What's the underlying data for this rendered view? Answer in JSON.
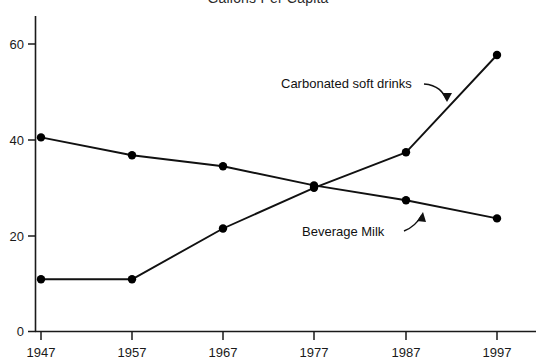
{
  "chart_data": {
    "type": "line",
    "title": "Gallons Per Capita",
    "xlabel": "",
    "ylabel": "",
    "x": [
      1947,
      1957,
      1967,
      1977,
      1987,
      1997
    ],
    "xtick_labels": [
      "1947",
      "1957",
      "1967",
      "1977",
      "1987",
      "1997"
    ],
    "ytick_labels": [
      "0",
      "20",
      "40",
      "60"
    ],
    "yticks": [
      0,
      20,
      40,
      60
    ],
    "ylim": [
      0,
      64
    ],
    "xlim": [
      1943,
      2000
    ],
    "grid": false,
    "legend": "none",
    "marker": "filled-circle",
    "series": [
      {
        "name": "Beverage Milk",
        "values": [
          40.5,
          36.8,
          34.5,
          30.5,
          27.4,
          23.6
        ]
      },
      {
        "name": "Carbonated soft drinks",
        "values": [
          10.9,
          10.9,
          21.5,
          30.0,
          37.4,
          57.7
        ]
      }
    ],
    "annotations": [
      {
        "text": "Carbonated soft drinks",
        "arrow": "curved-arrow-down-right",
        "points_to_series": "Carbonated soft drinks"
      },
      {
        "text": "Beverage Milk",
        "arrow": "curved-arrow-up-right",
        "points_to_series": "Beverage Milk"
      }
    ]
  },
  "axes": {
    "x_tick_1947": "1947",
    "x_tick_1957": "1957",
    "x_tick_1967": "1967",
    "x_tick_1977": "1977",
    "x_tick_1987": "1987",
    "x_tick_1997": "1997",
    "y_tick_0": "0",
    "y_tick_20": "20",
    "y_tick_40": "40",
    "y_tick_60": "60"
  },
  "annotations": {
    "soft_drinks_label": "Carbonated soft drinks",
    "milk_label": "Beverage Milk"
  },
  "colors": {
    "line": "#111111",
    "marker": "#000000",
    "axis": "#1a1a1a",
    "text": "#1a1a1a",
    "background": "#ffffff"
  }
}
